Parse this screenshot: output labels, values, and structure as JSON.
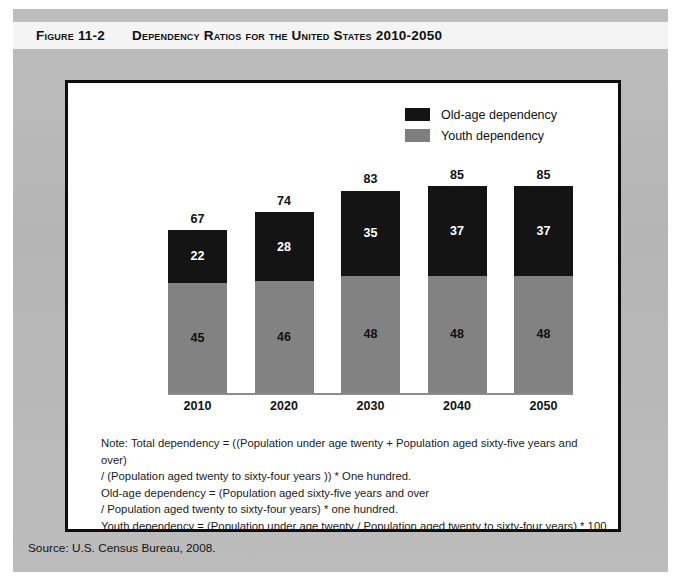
{
  "figure": {
    "number": "Figure 11-2",
    "title": "Dependency Ratios for the United States 2010-2050",
    "source": "Source: U.S. Census Bureau, 2008."
  },
  "legend": {
    "items": [
      {
        "label": "Old-age dependency",
        "color": "#141414",
        "key": "old_age"
      },
      {
        "label": "Youth dependency",
        "color": "#828282",
        "key": "youth"
      }
    ]
  },
  "notes": {
    "lines": [
      "Note: Total dependency = ((Population under age twenty + Population aged sixty-five years and",
      "over)",
      "/ (Population aged twenty to sixty-four years )) * One hundred.",
      "Old-age dependency = (Population aged sixty-five years and over",
      " / Population aged twenty to sixty-four years) * one hundred.",
      "Youth dependency = (Population under age twenty / Population aged twenty to sixty-four years) * 100."
    ]
  },
  "chart_data": {
    "type": "bar",
    "stacked": true,
    "title": "Dependency Ratios for the United States 2010-2050",
    "xlabel": "",
    "ylabel": "",
    "ylim": [
      0,
      100
    ],
    "grid": false,
    "legend_position": "top-right",
    "categories": [
      "2010",
      "2020",
      "2030",
      "2040",
      "2050"
    ],
    "series": [
      {
        "name": "Youth dependency",
        "color": "#828282",
        "values": [
          45,
          46,
          48,
          48,
          48
        ]
      },
      {
        "name": "Old-age dependency",
        "color": "#141414",
        "values": [
          22,
          28,
          35,
          37,
          37
        ]
      }
    ],
    "totals": [
      67,
      74,
      83,
      85,
      85
    ],
    "bars": [
      {
        "category": "2010",
        "youth": 45,
        "old_age": 22,
        "total": 67
      },
      {
        "category": "2020",
        "youth": 46,
        "old_age": 28,
        "total": 74
      },
      {
        "category": "2030",
        "youth": 48,
        "old_age": 35,
        "total": 83
      },
      {
        "category": "2040",
        "youth": 48,
        "old_age": 37,
        "total": 85
      },
      {
        "category": "2050",
        "youth": 48,
        "old_age": 37,
        "total": 85
      }
    ]
  }
}
